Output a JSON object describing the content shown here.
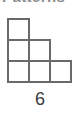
{
  "heading": {
    "text": "Patterns",
    "note": "clipped-at-top-edge"
  },
  "figure": {
    "name": "staircase-triangular-number",
    "count_label": "6",
    "rows": [
      {
        "row": 1,
        "squares": 1
      },
      {
        "row": 2,
        "squares": 2
      },
      {
        "row": 3,
        "squares": 3
      }
    ],
    "total_squares": 6,
    "alignment": "left",
    "cell_size_px": 21,
    "origin_x_px": 8,
    "origin_y_px": 7,
    "stroke_color": "#6a6a6a",
    "stroke_width_px": 2,
    "fill_color": "#ffffff",
    "label_color": "#3b3b3b"
  }
}
